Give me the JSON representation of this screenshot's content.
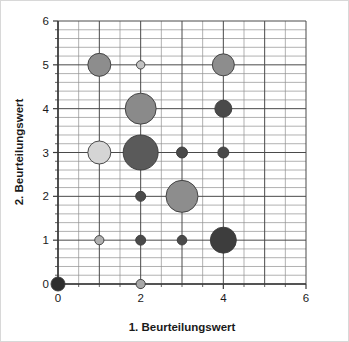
{
  "chart_data": {
    "type": "scatter",
    "title": "",
    "xlabel": "1. Beurteilungswert",
    "ylabel": "2. Beurteilungswert",
    "xlim": [
      0,
      6
    ],
    "ylim": [
      0,
      6
    ],
    "xticks": [
      0,
      2,
      4,
      6
    ],
    "xtick_labels": [
      "0",
      "2",
      "4",
      "6"
    ],
    "yticks": [
      0,
      1,
      2,
      3,
      4,
      5,
      6
    ],
    "ytick_labels": [
      "0",
      "1",
      "2",
      "3",
      "4",
      "5",
      "6"
    ],
    "x_minor_tick_step": 0.5,
    "y_minor_tick_step": 0.2,
    "grid": true,
    "grid_major_color": "#4a4a4a",
    "grid_minor_color": "#8f8f8f",
    "axis_color": "#3a3a3a",
    "legend": "none",
    "marker_shape": "circle",
    "marker_edge_color": "#3a3a3a",
    "points": [
      {
        "label": "p-0-0",
        "x": 0,
        "y": 0,
        "r": 7.0,
        "color": "#2e2e2e"
      },
      {
        "label": "p-2-0",
        "x": 2,
        "y": 0,
        "r": 4.6,
        "color": "#a8a8a8"
      },
      {
        "label": "p-1-1",
        "x": 1,
        "y": 1,
        "r": 4.6,
        "color": "#b0b0b0"
      },
      {
        "label": "p-2-1",
        "x": 2,
        "y": 1,
        "r": 5.0,
        "color": "#4a4a4a"
      },
      {
        "label": "p-3-1",
        "x": 3,
        "y": 1,
        "r": 4.8,
        "color": "#4a4a4a"
      },
      {
        "label": "p-4-1",
        "x": 4,
        "y": 1,
        "r": 13.0,
        "color": "#3d3d3d"
      },
      {
        "label": "p-2-2",
        "x": 2,
        "y": 2,
        "r": 5.0,
        "color": "#4a4a4a"
      },
      {
        "label": "p-3-2",
        "x": 3,
        "y": 2,
        "r": 16.0,
        "color": "#8d8d8d"
      },
      {
        "label": "p-1-3",
        "x": 1,
        "y": 3,
        "r": 11.5,
        "color": "#d5d5d5"
      },
      {
        "label": "p-2-3",
        "x": 2,
        "y": 3,
        "r": 17.5,
        "color": "#5a5a5a"
      },
      {
        "label": "p-3-3",
        "x": 3,
        "y": 3,
        "r": 5.5,
        "color": "#4a4a4a"
      },
      {
        "label": "p-4-3",
        "x": 4,
        "y": 3,
        "r": 5.5,
        "color": "#4a4a4a"
      },
      {
        "label": "p-2-4",
        "x": 2,
        "y": 4,
        "r": 15.5,
        "color": "#8a8a8a"
      },
      {
        "label": "p-4-4",
        "x": 4,
        "y": 4,
        "r": 8.5,
        "color": "#4a4a4a"
      },
      {
        "label": "p-1-5",
        "x": 1,
        "y": 5,
        "r": 11.5,
        "color": "#8d8d8d"
      },
      {
        "label": "p-2-5",
        "x": 2,
        "y": 5,
        "r": 4.2,
        "color": "#c2c2c2"
      },
      {
        "label": "p-4-5",
        "x": 4,
        "y": 5,
        "r": 11.0,
        "color": "#8d8d8d"
      }
    ]
  },
  "axes": {
    "x_title": "1. Beurteilungswert",
    "y_title": "2. Beurteilungswert"
  }
}
